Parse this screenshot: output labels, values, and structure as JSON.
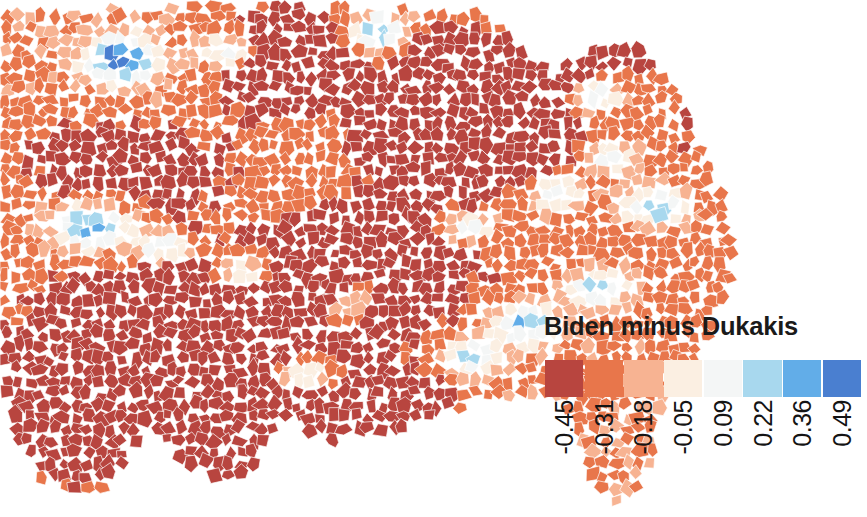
{
  "figure": {
    "width": 867,
    "height": 517,
    "background_color": "#ffffff",
    "type": "choropleth-map"
  },
  "legend": {
    "title": "Biden minus Dukakis",
    "title_color": "#1a1a1a",
    "orientation": "horizontal",
    "label_rotation_degrees": 90,
    "bins": [
      {
        "label": "-0.45",
        "color": "#b8453f"
      },
      {
        "label": "-0.31",
        "color": "#e8764b"
      },
      {
        "label": "-0.18",
        "color": "#f7b392"
      },
      {
        "label": "-0.05",
        "color": "#fbefe2"
      },
      {
        "label": "0.09",
        "color": "#f4f6f6"
      },
      {
        "label": "0.22",
        "color": "#a8d8ee"
      },
      {
        "label": "0.36",
        "color": "#62ade8"
      },
      {
        "label": "0.49",
        "color": "#4a7fd0"
      }
    ]
  },
  "chart_data": {
    "type": "heatmap",
    "subtype": "choropleth",
    "title": "Biden minus Dukakis",
    "xlabel": "",
    "ylabel": "",
    "geography": "United States counties (contiguous, cropped at left and top edges)",
    "measure": "Biden 2020 two-party vote share minus Dukakis 1988 two-party vote share",
    "colormap": "RdBu (diverging, red = negative / Dukakis stronger, blue = positive / Biden stronger)",
    "legend_position": "lower right, inside plot",
    "grid": false,
    "bin_edges": [
      -0.45,
      -0.31,
      -0.18,
      -0.05,
      0.09,
      0.22,
      0.36,
      0.49
    ],
    "bin_labels": [
      "-0.45",
      "-0.31",
      "-0.18",
      "-0.05",
      "0.09",
      "0.22",
      "0.36",
      "0.49"
    ],
    "bin_colors": [
      "#b8453f",
      "#e8764b",
      "#f7b392",
      "#fbefe2",
      "#f4f6f6",
      "#a8d8ee",
      "#62ade8",
      "#4a7fd0"
    ],
    "value_range": [
      -0.45,
      0.49
    ],
    "dominant_value_sign": "negative"
  }
}
